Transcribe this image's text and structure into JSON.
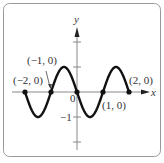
{
  "chart_data": {
    "type": "line",
    "title": "",
    "xlabel": "x",
    "ylabel": "y",
    "xlim": [
      -2.0,
      2.0
    ],
    "ylim": [
      -2.0,
      2.0
    ],
    "function": "y = -sin(pi x)",
    "x": [
      -2,
      -1.5,
      -1,
      -0.5,
      0,
      0.5,
      1,
      1.5,
      2
    ],
    "series": [
      {
        "name": "curve",
        "values": [
          0,
          -1,
          0,
          1,
          0,
          -1,
          0,
          1,
          0
        ]
      }
    ],
    "y_tick_labels": [
      "-1"
    ],
    "origin_label": "0",
    "grid": false,
    "points": [
      {
        "label": "(-2, 0)",
        "x": -2,
        "y": 0
      },
      {
        "label": "(-1, 0)",
        "x": -1,
        "y": 0
      },
      {
        "label": "(1, 0)",
        "x": 1,
        "y": 0
      },
      {
        "label": "(2, 0)",
        "x": 2,
        "y": 0
      },
      {
        "label": "",
        "x": 0,
        "y": 0
      }
    ],
    "annotations": [
      "(−2, 0)",
      "(−1, 0)",
      "(1, 0)",
      "(2, 0)"
    ]
  },
  "labels": {
    "x_axis": "x",
    "y_axis": "y",
    "origin": "0",
    "y_minus_one": "−1",
    "p_m2": "(−2, 0)",
    "p_m1": "(−1, 0)",
    "p_1": "(1, 0)",
    "p_2": "(2, 0)"
  }
}
